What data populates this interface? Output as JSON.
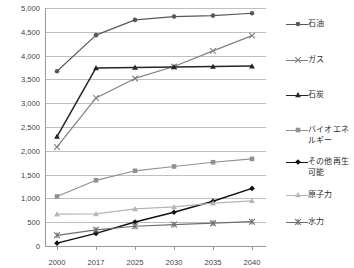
{
  "chart_data": {
    "type": "line",
    "title": "",
    "xlabel": "",
    "ylabel": "",
    "x": [
      "2000",
      "2017",
      "2025",
      "2030",
      "2035",
      "2040"
    ],
    "ylim": [
      0,
      5000
    ],
    "ytick_labels": [
      "0",
      "500",
      "1,000",
      "1,500",
      "2,000",
      "2,500",
      "3,000",
      "3,500",
      "4,000",
      "4,500",
      "5,000"
    ],
    "ytick_values": [
      0,
      500,
      1000,
      1500,
      2000,
      2500,
      3000,
      3500,
      4000,
      4500,
      5000
    ],
    "grid": true,
    "legend_position": "right",
    "series": [
      {
        "name": "石油",
        "values": [
          3670,
          4430,
          4750,
          4820,
          4840,
          4890
        ],
        "color": "#595959",
        "marker": "circle"
      },
      {
        "name": "ガス",
        "values": [
          2080,
          3110,
          3520,
          3770,
          4100,
          4420
        ],
        "color": "#808080",
        "marker": "cross"
      },
      {
        "name": "石炭",
        "values": [
          2300,
          3740,
          3750,
          3760,
          3770,
          3780
        ],
        "color": "#262626",
        "marker": "triangle"
      },
      {
        "name": "バイオエネ\nルギー",
        "values": [
          1040,
          1380,
          1580,
          1670,
          1760,
          1830
        ],
        "color": "#919191",
        "marker": "square"
      },
      {
        "name": "その他再生\n可能",
        "values": [
          60,
          265,
          505,
          710,
          940,
          1210
        ],
        "color": "#111111",
        "marker": "diamond"
      },
      {
        "name": "原子力",
        "values": [
          670,
          675,
          780,
          820,
          900,
          950
        ],
        "color": "#b5b5b5",
        "marker": "triangle"
      },
      {
        "name": "水力",
        "values": [
          225,
          340,
          415,
          450,
          480,
          510
        ],
        "color": "#6e6e6e",
        "marker": "asterisk"
      }
    ]
  },
  "legend": {
    "items": [
      {
        "label": "石油"
      },
      {
        "label": "ガス"
      },
      {
        "label": "石炭"
      },
      {
        "label": "バイオエネ\nルギー"
      },
      {
        "label": "その他再生\n可能"
      },
      {
        "label": "原子力"
      },
      {
        "label": "水力"
      }
    ]
  }
}
